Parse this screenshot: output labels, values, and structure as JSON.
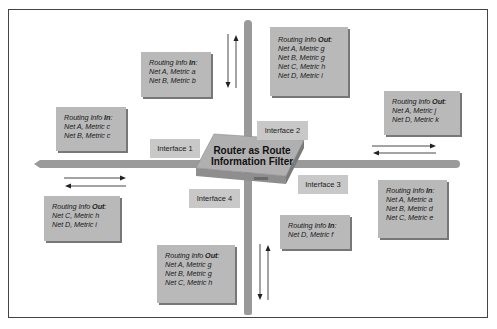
{
  "diagram": {
    "title": "Router as Route Information Filter",
    "router": {
      "line1": "Router as Route",
      "line2": "Information Filter"
    },
    "interfaces": [
      {
        "label": "Interface 1"
      },
      {
        "label": "Interface 2"
      },
      {
        "label": "Interface 3"
      },
      {
        "label": "Interface 4"
      }
    ],
    "boxes": {
      "iface1_in_upper": {
        "prefix": "Routing Info ",
        "dir": "In",
        "suffix": ":",
        "lines": [
          "Net A, Metric a",
          "Net B, Metric b"
        ]
      },
      "iface1_in_lower": {
        "prefix": "Routing Info ",
        "dir": "In",
        "suffix": ":",
        "lines": [
          "Net A, Metric c",
          "Net B, Metric c"
        ]
      },
      "iface2_out_upper": {
        "prefix": "Routing Info ",
        "dir": "Out",
        "suffix": ":",
        "lines": [
          "Net A, Metric g",
          "Net B, Metric g",
          "Net C, Metric h",
          "Net D, Metric i"
        ]
      },
      "iface2_out_right": {
        "prefix": "Routing Info ",
        "dir": "Out",
        "suffix": ":",
        "lines": [
          "Net A, Metric j",
          "Net D, Metric k"
        ]
      },
      "iface4_out_left": {
        "prefix": "Routing Info ",
        "dir": "Out",
        "suffix": ":",
        "lines": [
          "Net C, Metric h",
          "Net D, Metric i"
        ]
      },
      "iface3_in_mid": {
        "prefix": "Routing Info ",
        "dir": "In",
        "suffix": ":",
        "lines": [
          "Net D, Metric f"
        ]
      },
      "iface3_in_right": {
        "prefix": "Routing Info ",
        "dir": "In",
        "suffix": ":",
        "lines": [
          "Net A, Metric a",
          "Net B, Metric d",
          "Net C, Metric e"
        ]
      },
      "iface4_out_bottom": {
        "prefix": "Routing Info ",
        "dir": "Out",
        "suffix": ":",
        "lines": [
          "Net A, Metric g",
          "Net B, Metric g",
          "Net C, Metric h"
        ]
      }
    },
    "colors": {
      "box_fill": "#b9b9b9",
      "bar": "#9a9a9a",
      "interface_fill": "#c8c8c8",
      "border": "#444444"
    }
  }
}
